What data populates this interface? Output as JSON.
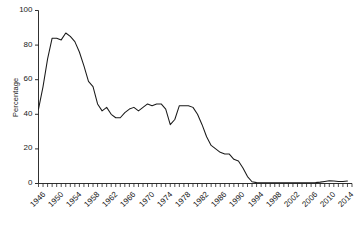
{
  "chart_data": {
    "type": "line",
    "title": "",
    "xlabel": "",
    "ylabel": "Percentage",
    "ylim": [
      0,
      100
    ],
    "xlim": [
      1946,
      2015
    ],
    "grid": false,
    "legend": null,
    "y_ticks": [
      0,
      20,
      40,
      60,
      80,
      100
    ],
    "x_ticks": [
      1946,
      1950,
      1954,
      1958,
      1962,
      1966,
      1970,
      1974,
      1978,
      1982,
      1986,
      1990,
      1994,
      1998,
      2002,
      2006,
      2010,
      2014
    ],
    "x_minor_tick_interval": 1,
    "line_color": "#1a1a1a",
    "series": [
      {
        "name": "Percentage",
        "x": [
          1946,
          1947,
          1948,
          1949,
          1950,
          1951,
          1952,
          1953,
          1954,
          1955,
          1956,
          1957,
          1958,
          1959,
          1960,
          1961,
          1962,
          1963,
          1964,
          1965,
          1966,
          1967,
          1968,
          1969,
          1970,
          1971,
          1972,
          1973,
          1974,
          1975,
          1976,
          1977,
          1978,
          1979,
          1980,
          1981,
          1982,
          1983,
          1984,
          1985,
          1986,
          1987,
          1988,
          1989,
          1990,
          1991,
          1992,
          1993,
          1994,
          1995,
          1996,
          1997,
          1998,
          1999,
          2000,
          2001,
          2002,
          2003,
          2004,
          2005,
          2006,
          2007,
          2008,
          2009,
          2010,
          2011,
          2012,
          2013,
          2014
        ],
        "values": [
          43,
          56,
          72,
          84,
          84,
          83,
          87,
          85,
          82,
          76,
          68,
          59,
          56,
          46,
          42,
          44,
          40,
          38,
          38,
          41,
          43,
          44,
          42,
          44,
          46,
          45,
          46,
          46,
          43,
          34,
          37,
          45,
          45,
          45,
          44,
          40,
          34,
          27,
          22,
          20,
          18,
          17,
          17,
          14,
          13,
          9,
          4,
          1,
          0.5,
          0.4,
          0.4,
          0.4,
          0.4,
          0.4,
          0.4,
          0.4,
          0.4,
          0.4,
          0.4,
          0.4,
          0.4,
          0.5,
          0.8,
          1.2,
          1.6,
          1.4,
          1.2,
          1.2,
          1.4
        ]
      }
    ]
  },
  "axes": {
    "y_axis_label": "Percentage",
    "y_tick_labels": [
      "0",
      "20",
      "40",
      "60",
      "80",
      "100"
    ],
    "x_tick_labels": [
      "1946",
      "1950",
      "1954",
      "1958",
      "1962",
      "1966",
      "1970",
      "1974",
      "1978",
      "1982",
      "1986",
      "1990",
      "1994",
      "1998",
      "2002",
      "2006",
      "2010",
      "2014"
    ]
  }
}
